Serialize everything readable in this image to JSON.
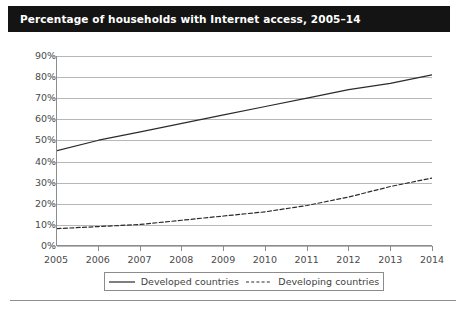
{
  "title": {
    "text": "Percentage of households with Internet access, 2005–14",
    "bar_color": "#141414",
    "text_color": "#ffffff"
  },
  "legend": {
    "position": "bottom-center",
    "entries": [
      {
        "label": "Developed countries",
        "style": "solid",
        "color": "#2b2b2b",
        "icon": "solid-line-icon"
      },
      {
        "label": "Developing countries",
        "style": "dashed",
        "color": "#2b2b2b",
        "icon": "dashed-line-icon"
      }
    ]
  },
  "axes": {
    "y_ticks": [
      "0%",
      "10%",
      "20%",
      "30%",
      "40%",
      "50%",
      "60%",
      "70%",
      "80%",
      "90%"
    ],
    "x_ticks": [
      "2005",
      "2006",
      "2007",
      "2008",
      "2009",
      "2010",
      "2011",
      "2012",
      "2013",
      "2014"
    ]
  },
  "chart_data": {
    "type": "line",
    "title": "Percentage of households with Internet access, 2005–14",
    "xlabel": "",
    "ylabel": "",
    "x": [
      2005,
      2006,
      2007,
      2008,
      2009,
      2010,
      2011,
      2012,
      2013,
      2014
    ],
    "categories": [
      "2005",
      "2006",
      "2007",
      "2008",
      "2009",
      "2010",
      "2011",
      "2012",
      "2013",
      "2014"
    ],
    "series": [
      {
        "name": "Developed countries",
        "style": "solid",
        "color": "#2b2b2b",
        "values": [
          45,
          50,
          54,
          58,
          62,
          66,
          70,
          74,
          77,
          81
        ]
      },
      {
        "name": "Developing countries",
        "style": "dashed",
        "color": "#2b2b2b",
        "values": [
          8,
          9,
          10,
          12,
          14,
          16,
          19,
          23,
          28,
          32
        ]
      }
    ],
    "ylim": [
      0,
      90
    ],
    "ytick_step": 10,
    "ytick_suffix": "%",
    "xlim": [
      2005,
      2014
    ],
    "grid": "horizontal",
    "legend_position": "bottom-center"
  }
}
